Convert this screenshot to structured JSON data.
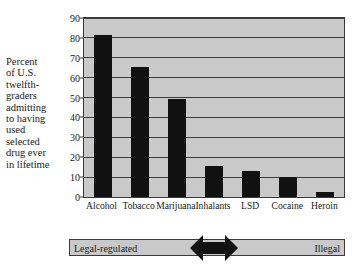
{
  "chart_data": {
    "type": "bar",
    "title": "",
    "subtitle": "",
    "xlabel": "",
    "ylabel": "Percent\nof U.S.\ntwelfth-\ngraders\nadmitting\nto having\nused\nselected\ndrug ever\nin lifetime",
    "categories": [
      "Alcohol",
      "Tobacco",
      "Marijuana",
      "Inhalants",
      "LSD",
      "Cocaine",
      "Heroin"
    ],
    "values": [
      81.5,
      65.5,
      49.5,
      15.5,
      13,
      10,
      2.5
    ],
    "ylim": [
      0,
      90
    ],
    "yticks": [
      0,
      10,
      20,
      30,
      40,
      50,
      60,
      70,
      80,
      90
    ],
    "ytick_labels": [
      "0",
      "10",
      "20",
      "30",
      "40",
      "50",
      "60",
      "70",
      "80",
      "90"
    ],
    "grid": true,
    "grid_axis": "y",
    "legend": false,
    "bar_color": "#111111",
    "plot_background": "#c9c9c9",
    "gridline_color": "#3c3c3c",
    "frame_color": "#3a3a3a"
  },
  "scale_bar": {
    "left_label": "Legal-regulated",
    "right_label": "Illegal",
    "arrow_icon": "double-arrow-icon",
    "background": "#c9c9c9"
  }
}
